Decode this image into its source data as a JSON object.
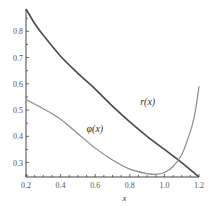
{
  "chart_data": {
    "type": "line",
    "title": "",
    "xlabel": "x",
    "ylabel": "",
    "xlim": [
      0.2,
      1.2
    ],
    "ylim": [
      0.245,
      0.885
    ],
    "grid": false,
    "x_ticks": [
      "0.2",
      "0.4",
      "0.6",
      "0.8",
      "1.0",
      "1.2"
    ],
    "x_tick_values": [
      0.2,
      0.4,
      0.6,
      0.8,
      1.0,
      1.2
    ],
    "y_ticks": [
      "0.3",
      "0.4",
      "0.5",
      "0.6",
      "0.7",
      "0.8"
    ],
    "y_tick_values": [
      0.3,
      0.4,
      0.5,
      0.6,
      0.7,
      0.8
    ],
    "series": [
      {
        "name": "r(x)",
        "label": "r(x)",
        "color": "#4a4a4a",
        "x": [
          0.2,
          0.25,
          0.3,
          0.4,
          0.5,
          0.6,
          0.7,
          0.8,
          0.9,
          1.0,
          1.1,
          1.2
        ],
        "y": [
          0.885,
          0.83,
          0.785,
          0.705,
          0.64,
          0.58,
          0.515,
          0.455,
          0.4,
          0.35,
          0.3,
          0.245
        ]
      },
      {
        "name": "φ(x)",
        "label": "φ(x)",
        "color": "#8a8a8a",
        "x": [
          0.2,
          0.3,
          0.4,
          0.5,
          0.6,
          0.7,
          0.8,
          0.9,
          0.95,
          1.0,
          1.05,
          1.1,
          1.13,
          1.16,
          1.18,
          1.2
        ],
        "y": [
          0.54,
          0.505,
          0.465,
          0.41,
          0.355,
          0.31,
          0.275,
          0.258,
          0.255,
          0.262,
          0.285,
          0.33,
          0.38,
          0.44,
          0.5,
          0.59
        ]
      }
    ],
    "annotations": [
      {
        "text": "r(x)",
        "x": 0.86,
        "y": 0.52
      },
      {
        "text": "φ(x)",
        "x": 0.55,
        "y": 0.415
      }
    ]
  }
}
